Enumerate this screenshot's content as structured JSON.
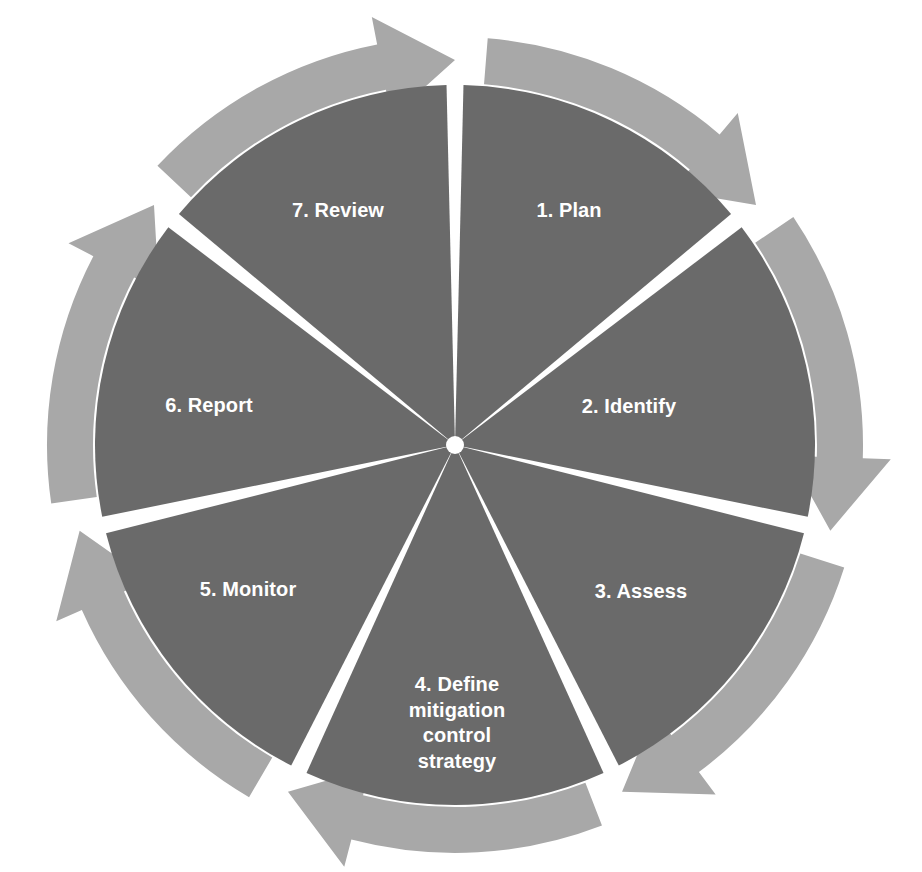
{
  "diagram": {
    "type": "circular-process-cycle",
    "direction": "clockwise",
    "segment_count": 7,
    "colors": {
      "inner_disc": "#6a6a6a",
      "arrow_ring": "#a8a8a8",
      "divider": "#ffffff",
      "label_text": "#ffffff",
      "background": "#ffffff"
    },
    "geometry": {
      "center_x": 455,
      "center_y": 445,
      "inner_radius": 360,
      "ring_inner_radius": 362,
      "ring_outer_radius": 408,
      "arrow_head_radius": 436,
      "spoke_half_width_deg": 1.35,
      "start_angle_deg": -90
    },
    "steps": [
      {
        "index": 1,
        "number": "1.",
        "name": "Plan",
        "label": "1. Plan",
        "label_x": 569,
        "label_y": 211
      },
      {
        "index": 2,
        "number": "2.",
        "name": "Identify",
        "label": "2. Identify",
        "label_y": 407,
        "label_x": 629
      },
      {
        "index": 3,
        "number": "3.",
        "name": "Assess",
        "label": "3. Assess",
        "label_x": 641,
        "label_y": 592
      },
      {
        "index": 4,
        "number": "4.",
        "name": "Define mitigation control strategy",
        "label": "4. Define\nmitigation\ncontrol\nstrategy",
        "label_x": 457,
        "label_y": 723
      },
      {
        "index": 5,
        "number": "5.",
        "name": "Monitor",
        "label": "5. Monitor",
        "label_x": 248,
        "label_y": 590
      },
      {
        "index": 6,
        "number": "6.",
        "name": "Report",
        "label": "6. Report",
        "label_x": 209,
        "label_y": 406
      },
      {
        "index": 7,
        "number": "7.",
        "name": "Review",
        "label": "7. Review",
        "label_x": 338,
        "label_y": 211
      }
    ]
  }
}
